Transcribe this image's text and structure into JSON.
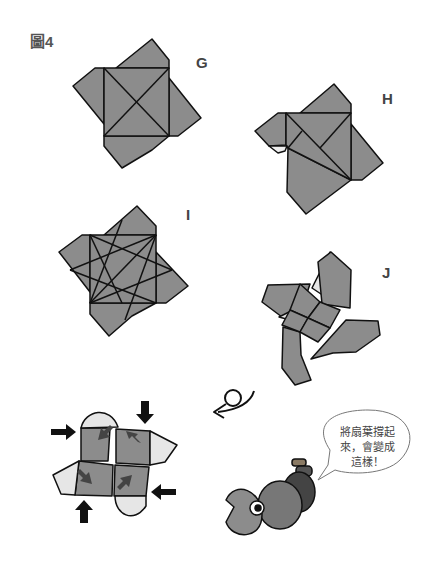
{
  "figure": {
    "label": "圖4"
  },
  "steps": [
    {
      "id": "G",
      "label": "G"
    },
    {
      "id": "H",
      "label": "H"
    },
    {
      "id": "I",
      "label": "I"
    },
    {
      "id": "J",
      "label": "J"
    }
  ],
  "speech_bubble": {
    "line1": "將扇葉撐起",
    "line2": "來，會變成",
    "line3": "這樣！"
  },
  "colors": {
    "paper_dark": "#8c8c8c",
    "paper_light": "#e6e6e6",
    "stroke": "#111111",
    "label": "#444444"
  }
}
